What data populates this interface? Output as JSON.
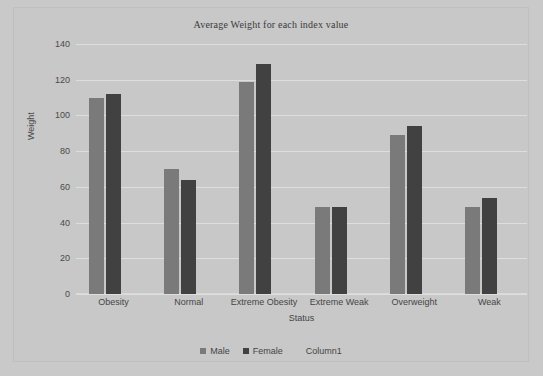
{
  "chart_data": {
    "type": "bar",
    "title": "Average Weight for each index value",
    "xlabel": "Status",
    "ylabel": "Weight",
    "categories": [
      "Obesity",
      "Normal",
      "Extreme Obesity",
      "Extreme Weak",
      "Overweight",
      "Weak"
    ],
    "series": [
      {
        "name": "Male",
        "color": "#7a7a7a",
        "values": [
          110,
          70,
          119,
          49,
          89,
          49
        ]
      },
      {
        "name": "Female",
        "color": "#414141",
        "values": [
          112,
          64,
          129,
          49,
          94,
          54
        ]
      },
      {
        "name": "Column1",
        "color": "transparent",
        "values": [
          0,
          0,
          0,
          0,
          0,
          0
        ]
      }
    ],
    "ylim": [
      0,
      140
    ],
    "ytick_labels": [
      "140",
      "120",
      "100",
      "80",
      "60",
      "40",
      "20",
      "0"
    ],
    "ytick_values": [
      140,
      120,
      100,
      80,
      60,
      40,
      20,
      0
    ],
    "grid": true,
    "legend_position": "bottom",
    "plot_background": "#c8c8c8",
    "gridline_color": "#dedede"
  },
  "legend": {
    "items": [
      {
        "label": "Male"
      },
      {
        "label": "Female"
      },
      {
        "label": "Column1"
      }
    ]
  }
}
